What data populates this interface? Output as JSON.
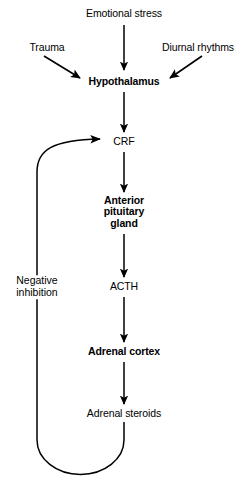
{
  "diagram": {
    "stroke_color": "#000000",
    "background_color": "#ffffff",
    "nodes": [
      {
        "id": "emotional-stress",
        "label": "Emotional stress",
        "weight": "regular",
        "x": 124,
        "y": 14
      },
      {
        "id": "trauma",
        "label": "Trauma",
        "weight": "regular",
        "x": 47,
        "y": 48
      },
      {
        "id": "diurnal-rhythms",
        "label": "Diurnal rhythms",
        "weight": "regular",
        "x": 198,
        "y": 48
      },
      {
        "id": "hypothalamus",
        "label": "Hypothalamus",
        "weight": "bold",
        "x": 124,
        "y": 82
      },
      {
        "id": "crf",
        "label": "CRF",
        "weight": "regular",
        "x": 124,
        "y": 142
      },
      {
        "id": "anterior-pituitary-gland",
        "label": "Anterior\npituitary\ngland",
        "weight": "bold",
        "x": 124,
        "y": 212
      },
      {
        "id": "acth",
        "label": "ACTH",
        "weight": "regular",
        "x": 124,
        "y": 287
      },
      {
        "id": "adrenal-cortex",
        "label": "Adrenal cortex",
        "weight": "bold",
        "x": 124,
        "y": 352
      },
      {
        "id": "adrenal-steroids",
        "label": "Adrenal steroids",
        "weight": "regular",
        "x": 124,
        "y": 414
      }
    ],
    "feedback": {
      "id": "negative-inhibition",
      "label": "Negative\ninhibition",
      "x": 37,
      "y": 287
    }
  }
}
